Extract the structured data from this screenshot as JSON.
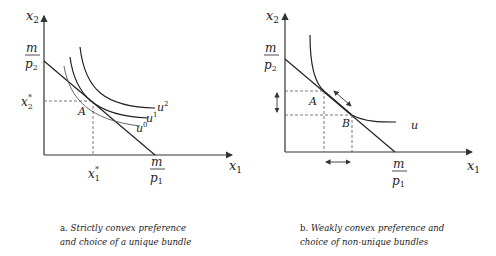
{
  "panel_a": {
    "y_axis_label": "x2",
    "x_axis_label": "x1",
    "y_intercept_num": "m",
    "y_intercept_den": "p2",
    "x_intercept_num": "m",
    "x_intercept_den": "p1",
    "x2_star": "x2*",
    "x1_star": "x1*",
    "point": "A",
    "curves": [
      "u0",
      "u1",
      "u2"
    ],
    "caption_prefix": "a.",
    "caption_line1": "Strictly convex preference",
    "caption_line2": "and choice of a unique bundle"
  },
  "panel_b": {
    "y_axis_label": "x2",
    "x_axis_label": "x1",
    "y_intercept_num": "m",
    "y_intercept_den": "p2",
    "x_intercept_num": "m",
    "x_intercept_den": "p1",
    "points": [
      "A",
      "B"
    ],
    "curve": "u",
    "caption_prefix": "b.",
    "caption_line1": "Weakly convex preference and",
    "caption_line2": "choice of non-unique bundles"
  }
}
